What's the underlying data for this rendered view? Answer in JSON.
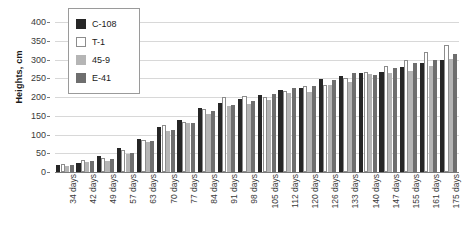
{
  "chart_data": {
    "type": "bar",
    "title": "",
    "xlabel": "",
    "ylabel": "Heights, cm",
    "ylim": [
      0,
      400
    ],
    "ytick_step": 50,
    "yticks": [
      0,
      50,
      100,
      150,
      200,
      250,
      300,
      350,
      400
    ],
    "grid": true,
    "legend_position": "upper-left-inside",
    "categories": [
      "34 days",
      "42 days",
      "49 days",
      "57 days",
      "63 days",
      "70 days",
      "77 days",
      "84 days",
      "91 days",
      "98 days",
      "105 days",
      "112 days",
      "120 days",
      "126 days",
      "133 days",
      "140 days",
      "147 days",
      "155 days",
      "161 days",
      "175 days"
    ],
    "series": [
      {
        "name": "C-108",
        "color": "#262626",
        "values": [
          20,
          25,
          44,
          65,
          89,
          120,
          140,
          170,
          185,
          195,
          205,
          218,
          224,
          247,
          257,
          263,
          268,
          280,
          290,
          300
        ]
      },
      {
        "name": "T-1",
        "color": "#ffffff",
        "values": [
          21,
          31,
          38,
          60,
          86,
          125,
          134,
          168,
          200,
          204,
          200,
          215,
          230,
          232,
          252,
          266,
          282,
          300,
          320,
          340
        ]
      },
      {
        "name": "45-9",
        "color": "#b5b5b5",
        "values": [
          17,
          26,
          29,
          49,
          81,
          109,
          132,
          155,
          177,
          181,
          191,
          212,
          213,
          231,
          241,
          262,
          265,
          270,
          283,
          302
        ]
      },
      {
        "name": "E-41",
        "color": "#6e6e6e",
        "values": [
          18,
          29,
          35,
          52,
          84,
          112,
          130,
          163,
          180,
          190,
          207,
          223,
          229,
          246,
          263,
          258,
          277,
          290,
          300,
          315
        ]
      }
    ]
  },
  "legend": {
    "items": [
      {
        "label": "C-108"
      },
      {
        "label": "T-1"
      },
      {
        "label": "45-9"
      },
      {
        "label": "E-41"
      }
    ]
  },
  "axes": {
    "y_title": "Heights, cm"
  }
}
